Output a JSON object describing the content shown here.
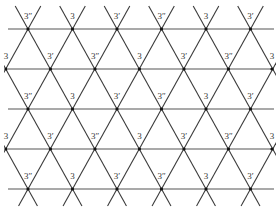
{
  "diagram": {
    "type": "triangular-lattice",
    "colors": {
      "line": "#3a3a3a",
      "hline": "#555555",
      "vertex": "#111111",
      "label": "#333333",
      "background": "#ffffff"
    },
    "geometry": {
      "row_y": [
        29,
        69,
        109,
        149,
        189
      ],
      "odd_row_x": [
        28,
        72.5,
        117,
        161.5,
        206,
        250.5
      ],
      "even_row_x": [
        6,
        50.5,
        95,
        139.5,
        184,
        228.5,
        272
      ],
      "hline_x_start": 8,
      "hline_x_end": 274,
      "top_y": 6,
      "bottom_y": 206
    },
    "rows": [
      {
        "index": 1,
        "labels": [
          "3''",
          "3",
          "3'",
          "3''",
          "3",
          "3'"
        ]
      },
      {
        "index": 2,
        "labels": [
          "3",
          "3'",
          "3''",
          "3",
          "3'",
          "3''",
          "3"
        ]
      },
      {
        "index": 3,
        "labels": [
          "3''",
          "3",
          "3'",
          "3''",
          "3",
          "3'"
        ]
      },
      {
        "index": 4,
        "labels": [
          "3",
          "3'",
          "3''",
          "3",
          "3'",
          "3''",
          "3"
        ]
      },
      {
        "index": 5,
        "labels": [
          "3''",
          "3",
          "3'",
          "3''",
          "3",
          "3'"
        ]
      }
    ]
  }
}
